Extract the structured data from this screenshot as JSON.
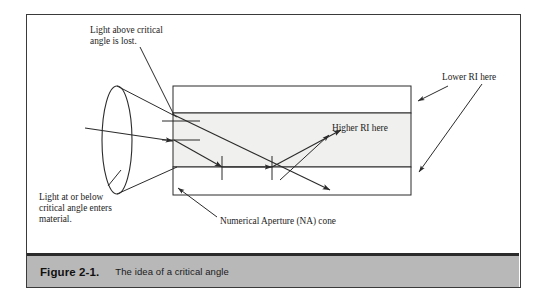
{
  "figure": {
    "caption_number": "Figure 2-1.",
    "caption_text": "The idea of a critical angle"
  },
  "annotations": {
    "top_left": {
      "line1": "Light above critical",
      "line2": "angle is lost."
    },
    "bottom_left": {
      "line1": "Light at or below",
      "line2": "critical angle enters",
      "line3": "material."
    },
    "na_cone": "Numerical Aperture  (NA) cone",
    "lower_ri": "Lower RI here",
    "higher_ri": "Higher RI here"
  },
  "colors": {
    "frame_border": "#3a3a3a",
    "caption_bar": "#b8b8b8",
    "caption_rule": "#2b2b2b",
    "core_fill": "#f0f0ee",
    "cladding_fill": "#ffffff",
    "stroke": "#2b2b2b",
    "text": "#1c1c1c"
  },
  "diagram": {
    "type": "optical-fiber-critical-angle",
    "waveguide": {
      "left": 173,
      "right": 411,
      "top": 86,
      "bottom": 195,
      "core_top": 113,
      "core_bottom": 167
    },
    "lens_ellipse": {
      "cx": 117,
      "cy": 140,
      "rx": 15,
      "ry": 54
    },
    "rays": [
      {
        "name": "input-ray",
        "from": [
          85,
          128
        ],
        "to": [
          176,
          141
        ]
      },
      {
        "name": "lost-ray",
        "from": [
          176,
          116
        ],
        "to": [
          330,
          190
        ]
      },
      {
        "name": "guided-ray-in",
        "from": [
          176,
          141
        ],
        "to": [
          222,
          167
        ]
      },
      {
        "name": "guided-ray-bounce",
        "from": [
          222,
          167
        ],
        "to": [
          272,
          167
        ]
      },
      {
        "name": "guided-ray-out",
        "from": [
          272,
          167
        ],
        "to": [
          340,
          131
        ]
      }
    ],
    "normals": [
      {
        "name": "normal-upper-entry",
        "x1": 162,
        "y1": 121,
        "x2": 200,
        "y2": 121
      },
      {
        "name": "normal-lower-entry",
        "x1": 162,
        "y1": 140,
        "x2": 200,
        "y2": 140
      },
      {
        "name": "tick-bounce-1",
        "x1": 222,
        "y1": 156,
        "x2": 222,
        "y2": 180
      },
      {
        "name": "tick-bounce-2",
        "x1": 272,
        "y1": 156,
        "x2": 272,
        "y2": 180
      }
    ]
  }
}
